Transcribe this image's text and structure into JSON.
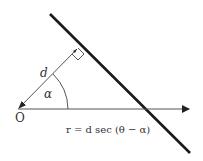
{
  "diagram": {
    "labels": {
      "origin": "O",
      "distance": "d",
      "angle": "α",
      "equation": "r = d sec (θ − α)"
    },
    "colors": {
      "line": "#1a1a1a",
      "axis": "#555555",
      "ray": "#555555",
      "text": "#333333",
      "background": "#ffffff"
    },
    "elements": [
      {
        "id": "straight-line",
        "type": "line",
        "from": [
          50,
          14
        ],
        "to": [
          190,
          153
        ],
        "weight": "thick"
      },
      {
        "id": "polar-axis",
        "type": "arrow",
        "from": [
          18,
          109
        ],
        "to": [
          189,
          109
        ]
      },
      {
        "id": "perpendicular",
        "type": "arrow",
        "from": [
          77,
          49
        ],
        "to": [
          18,
          109
        ],
        "label": "d"
      },
      {
        "id": "right-angle-marker",
        "type": "square",
        "at": [
          77,
          49
        ]
      },
      {
        "id": "angle-arc",
        "type": "arc",
        "center": [
          18,
          109
        ],
        "radius": 50,
        "label": "α"
      }
    ]
  }
}
